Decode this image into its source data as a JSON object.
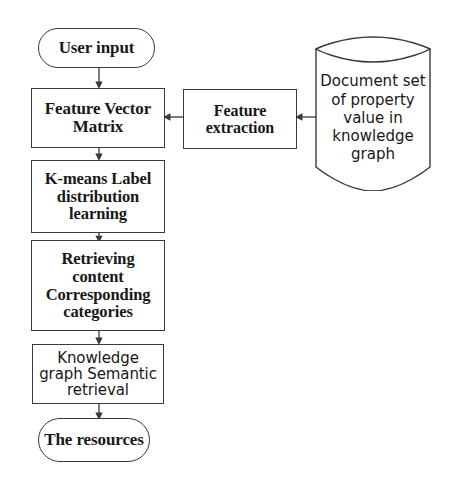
{
  "diagram": {
    "background_color": "#ffffff",
    "stroke_color": "#3a3a3a",
    "text_color": "#181818",
    "nodes": {
      "user_input": {
        "label": "User  input",
        "shape": "stadium"
      },
      "feature_vector_matrix": {
        "label": "Feature Vector\nMatrix",
        "shape": "rectangle"
      },
      "kmeans": {
        "label": "K-means Label\ndistribution\nlearning",
        "shape": "rectangle"
      },
      "retrieving": {
        "label": "Retrieving\ncontent\nCorresponding\ncategories",
        "shape": "rectangle"
      },
      "knowledge_graph_semantic": {
        "label": "Knowledge\ngraph Semantic\nretrieval",
        "shape": "rectangle"
      },
      "the_resources": {
        "label": "The resources",
        "shape": "stadium"
      },
      "feature_extraction": {
        "label": "Feature\nextraction",
        "shape": "rectangle"
      },
      "document_set": {
        "label": "Document set\nof property\nvalue in\nknowledge\ngraph",
        "shape": "cylinder"
      }
    },
    "edges": [
      {
        "from": "user_input",
        "to": "feature_vector_matrix",
        "direction": "down"
      },
      {
        "from": "feature_vector_matrix",
        "to": "kmeans",
        "direction": "down"
      },
      {
        "from": "kmeans",
        "to": "retrieving",
        "direction": "down"
      },
      {
        "from": "retrieving",
        "to": "knowledge_graph_semantic",
        "direction": "down"
      },
      {
        "from": "knowledge_graph_semantic",
        "to": "the_resources",
        "direction": "down"
      },
      {
        "from": "document_set",
        "to": "feature_extraction",
        "direction": "left"
      },
      {
        "from": "feature_extraction",
        "to": "feature_vector_matrix",
        "direction": "left"
      }
    ]
  }
}
